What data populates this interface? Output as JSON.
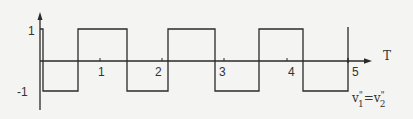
{
  "diagram": {
    "type": "square-wave",
    "y_axis": {
      "ticks": [
        {
          "label": "1",
          "value": 1
        },
        {
          "label": "-1",
          "value": -1
        }
      ]
    },
    "x_axis": {
      "label": "T",
      "ticks": [
        {
          "label": "1",
          "value": 1
        },
        {
          "label": "2",
          "value": 2
        },
        {
          "label": "3",
          "value": 3
        },
        {
          "label": "4",
          "value": 4
        },
        {
          "label": "5",
          "value": 5
        }
      ]
    },
    "waveform_label": {
      "v": "v",
      "prime1": "\"",
      "sub1": "1",
      "eq": "=",
      "prime2": "\"",
      "sub2": "2"
    },
    "colors": {
      "line": "#2a2a2a",
      "background": "#f4f4f2"
    }
  }
}
